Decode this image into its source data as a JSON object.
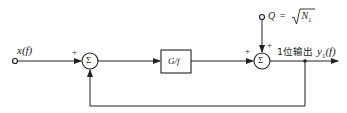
{
  "diagram": {
    "type": "feedback-block-diagram",
    "input": {
      "label": "x(f)"
    },
    "summer1": {
      "symbol": "Σ",
      "sign_input": "+"
    },
    "block": {
      "label": "G/f"
    },
    "summer2": {
      "symbol": "Σ",
      "sign_left": "+",
      "sign_top": "+"
    },
    "noise_input": {
      "label_lhs": "Q",
      "label_eq": "=",
      "label_rhs": "N",
      "label_sub": "1"
    },
    "output": {
      "caption": "1位输出",
      "label_main": "y",
      "label_sub": "1",
      "label_arg": "(f)"
    },
    "colors": {
      "line": "#222222",
      "background": "#ffffff"
    }
  }
}
